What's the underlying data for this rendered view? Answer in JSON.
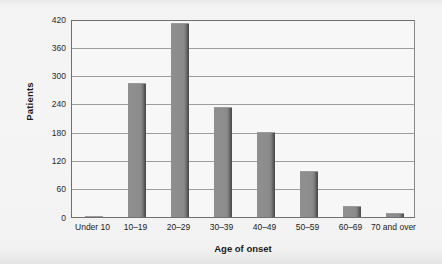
{
  "chart_data": {
    "type": "bar",
    "title": "",
    "xlabel": "Age of onset",
    "ylabel": "Patients",
    "categories": [
      "Under 10",
      "10–19",
      "20–29",
      "30–39",
      "40–49",
      "50–59",
      "60–69",
      "70 and over"
    ],
    "values": [
      3,
      285,
      412,
      233,
      180,
      98,
      23,
      8
    ],
    "ylim": [
      0,
      420
    ],
    "yticks": [
      0,
      60,
      120,
      180,
      240,
      300,
      360,
      420
    ],
    "ytick_labels": [
      "0",
      "60",
      "120",
      "180",
      "240",
      "300",
      "360",
      "420"
    ],
    "grid": true,
    "legend": null,
    "series": [
      {
        "name": "Patients",
        "values": [
          3,
          285,
          412,
          233,
          180,
          98,
          23,
          8
        ]
      }
    ],
    "colors": {
      "bar_fill": "#8c8c8c",
      "bar_shadow": "#4a4a4a",
      "gridline": "#9d9d9d",
      "axis": "#6f6f6f",
      "plot_background": "#f7f7f7",
      "figure_background": "#f4f4f4",
      "text": "#1b1b1b"
    }
  }
}
